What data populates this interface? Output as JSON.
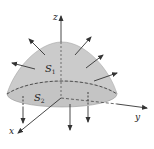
{
  "diagram": {
    "colors": {
      "background": "#ffffff",
      "surface": "#c9c9c9",
      "surface_edge": "#a8a8a8",
      "lines": "#333333"
    },
    "axes": {
      "x_label": "x",
      "y_label": "y",
      "z_label": "z"
    },
    "surfaces": {
      "top_label": "S",
      "top_subscript": "1",
      "bottom_label": "S",
      "bottom_subscript": "2"
    }
  }
}
